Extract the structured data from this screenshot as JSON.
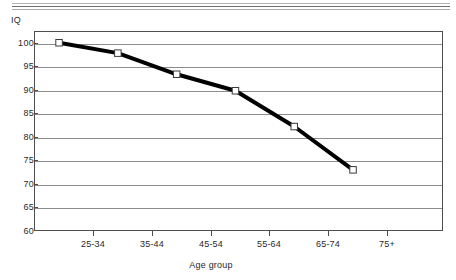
{
  "chart_data": {
    "type": "line",
    "title": "",
    "xlabel": "Age group",
    "ylabel": "IQ",
    "categories": [
      "25-34",
      "35-44",
      "45-54",
      "55-64",
      "65-74",
      "75+"
    ],
    "values": [
      100,
      97.8,
      93.3,
      89.8,
      82.2,
      73
    ],
    "series": [
      {
        "name": "IQ",
        "values": [
          100,
          97.8,
          93.3,
          89.8,
          82.2,
          73
        ]
      }
    ],
    "ylim": [
      60,
      102.5
    ],
    "yticks": [
      100,
      95,
      90,
      85,
      80,
      75,
      70,
      65,
      60
    ],
    "ytick_labels": [
      "100",
      "95",
      "90",
      "85",
      "80",
      "75",
      "70",
      "65",
      "60"
    ],
    "grid": "horizontal",
    "legend": "none",
    "marker": "open-square",
    "line_color": "#000000",
    "grid_color": "#8c8c8c",
    "frame_color": "#4d4d4d"
  },
  "header": {
    "rules": [
      "rule-top",
      "rule-middle",
      "rule-bottom"
    ]
  }
}
